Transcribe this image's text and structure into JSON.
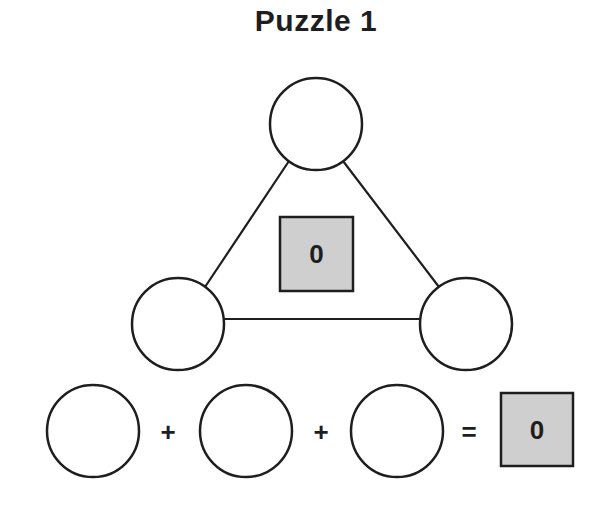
{
  "title": "Puzzle 1",
  "triangle": {
    "nodes": [
      {
        "id": "top",
        "value": ""
      },
      {
        "id": "left",
        "value": ""
      },
      {
        "id": "right",
        "value": ""
      }
    ],
    "center_value": "0"
  },
  "equation": {
    "terms": [
      "",
      "",
      ""
    ],
    "operators": [
      "+",
      "+"
    ],
    "equals": "=",
    "result": "0"
  },
  "colors": {
    "stroke": "#1e1e1e",
    "box_fill": "#cfcfcf",
    "background": "#ffffff"
  }
}
